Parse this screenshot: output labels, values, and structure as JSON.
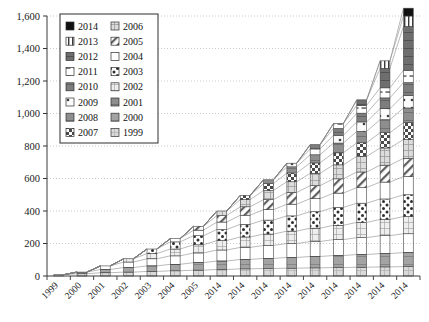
{
  "chart_data": {
    "type": "bar",
    "subtype": "stacked-column-with-connectors",
    "title": "",
    "subtitle": "",
    "xlabel": "",
    "ylabel": "",
    "ylim": [
      0,
      1600
    ],
    "ytick_values": [
      0,
      200,
      400,
      600,
      800,
      1000,
      1200,
      1400,
      1600
    ],
    "ytick_labels": [
      "0",
      "200",
      "400",
      "600",
      "800",
      "1,000",
      "1,200",
      "1,400",
      "1,600"
    ],
    "grid": "horizontal-dotted",
    "legend_position": "top-left-inside",
    "categories": [
      "1999",
      "2000",
      "2001",
      "2002",
      "2003",
      "2004",
      "2005",
      "2014",
      "2014",
      "2014",
      "2014",
      "2014",
      "2014",
      "2014",
      "2014",
      "2014"
    ],
    "series": [
      {
        "name": "1999",
        "pattern": "light-grid",
        "values": [
          8,
          14,
          20,
          24,
          28,
          32,
          36,
          40,
          44,
          46,
          48,
          50,
          52,
          54,
          56,
          58
        ]
      },
      {
        "name": "2000",
        "pattern": "mid-gray",
        "values": [
          0,
          10,
          20,
          28,
          34,
          40,
          46,
          52,
          58,
          62,
          66,
          70,
          74,
          78,
          82,
          86
        ]
      },
      {
        "name": "2001",
        "pattern": "dark-gray",
        "values": [
          0,
          0,
          22,
          34,
          44,
          52,
          60,
          68,
          74,
          80,
          86,
          92,
          98,
          104,
          110,
          116
        ]
      },
      {
        "name": "2002",
        "pattern": "light-grid2",
        "values": [
          0,
          0,
          0,
          20,
          32,
          42,
          50,
          58,
          64,
          70,
          76,
          82,
          88,
          94,
          100,
          106
        ]
      },
      {
        "name": "2003",
        "pattern": "polka-dot",
        "values": [
          0,
          0,
          0,
          0,
          28,
          44,
          56,
          68,
          78,
          86,
          94,
          102,
          110,
          118,
          126,
          134
        ]
      },
      {
        "name": "2004",
        "pattern": "white",
        "values": [
          0,
          0,
          0,
          0,
          0,
          20,
          34,
          46,
          56,
          64,
          72,
          80,
          88,
          96,
          104,
          112
        ]
      },
      {
        "name": "2005",
        "pattern": "diag-hatch",
        "values": [
          0,
          0,
          0,
          0,
          0,
          0,
          24,
          40,
          52,
          62,
          72,
          80,
          88,
          96,
          104,
          112
        ]
      },
      {
        "name": "2006",
        "pattern": "pale-grid",
        "values": [
          0,
          0,
          0,
          0,
          0,
          0,
          0,
          28,
          44,
          56,
          66,
          76,
          86,
          96,
          106,
          116
        ]
      },
      {
        "name": "2007",
        "pattern": "checker",
        "values": [
          0,
          0,
          0,
          0,
          0,
          0,
          0,
          0,
          26,
          42,
          54,
          64,
          74,
          84,
          94,
          104
        ]
      },
      {
        "name": "2008",
        "pattern": "med-gray",
        "values": [
          0,
          0,
          0,
          0,
          0,
          0,
          0,
          0,
          0,
          24,
          38,
          50,
          60,
          70,
          80,
          90
        ]
      },
      {
        "name": "2009",
        "pattern": "white-dot",
        "values": [
          0,
          0,
          0,
          0,
          0,
          0,
          0,
          0,
          0,
          0,
          22,
          36,
          48,
          58,
          68,
          78
        ]
      },
      {
        "name": "2010",
        "pattern": "dark-mid",
        "values": [
          0,
          0,
          0,
          0,
          0,
          0,
          0,
          0,
          0,
          0,
          0,
          26,
          42,
          54,
          66,
          78
        ]
      },
      {
        "name": "2011",
        "pattern": "dash-box",
        "values": [
          0,
          0,
          0,
          0,
          0,
          0,
          0,
          0,
          0,
          0,
          0,
          0,
          30,
          48,
          62,
          76
        ]
      },
      {
        "name": "2012",
        "pattern": "dark-slate",
        "values": [
          0,
          0,
          0,
          0,
          0,
          0,
          0,
          0,
          0,
          0,
          0,
          0,
          0,
          34,
          120,
          270
        ]
      },
      {
        "name": "2013",
        "pattern": "vert-stripe",
        "values": [
          0,
          0,
          0,
          0,
          0,
          0,
          0,
          0,
          0,
          0,
          0,
          0,
          0,
          0,
          46,
          64
        ]
      },
      {
        "name": "2014",
        "pattern": "solid-black",
        "values": [
          0,
          0,
          0,
          0,
          0,
          0,
          0,
          0,
          0,
          0,
          0,
          0,
          0,
          0,
          0,
          48
        ]
      }
    ],
    "totals": [
      8,
      24,
      62,
      106,
      166,
      230,
      306,
      400,
      496,
      552,
      594,
      708,
      790,
      936,
      1184,
      1448
    ],
    "connectors": true
  },
  "legend": {
    "columns": 2,
    "col1": [
      {
        "label": "2014",
        "pattern": "solid-black"
      },
      {
        "label": "2013",
        "pattern": "vert-stripe"
      },
      {
        "label": "2012",
        "pattern": "dark-slate"
      },
      {
        "label": "2011",
        "pattern": "dash-box"
      },
      {
        "label": "2010",
        "pattern": "dark-mid"
      },
      {
        "label": "2009",
        "pattern": "white-dot"
      },
      {
        "label": "2008",
        "pattern": "med-gray"
      },
      {
        "label": "2007",
        "pattern": "checker"
      }
    ],
    "col2": [
      {
        "label": "2006",
        "pattern": "pale-grid"
      },
      {
        "label": "2005",
        "pattern": "diag-hatch"
      },
      {
        "label": "2004",
        "pattern": "white"
      },
      {
        "label": "2003",
        "pattern": "polka-dot"
      },
      {
        "label": "2002",
        "pattern": "light-grid2"
      },
      {
        "label": "2001",
        "pattern": "med-gray"
      },
      {
        "label": "2000",
        "pattern": "mid-gray"
      },
      {
        "label": "1999",
        "pattern": "light-grid"
      }
    ]
  },
  "colors": {
    "axis": "#333333",
    "grid": "#bcbcbc",
    "background": "#ffffff",
    "outline": "#404040",
    "connector": "#808080"
  }
}
